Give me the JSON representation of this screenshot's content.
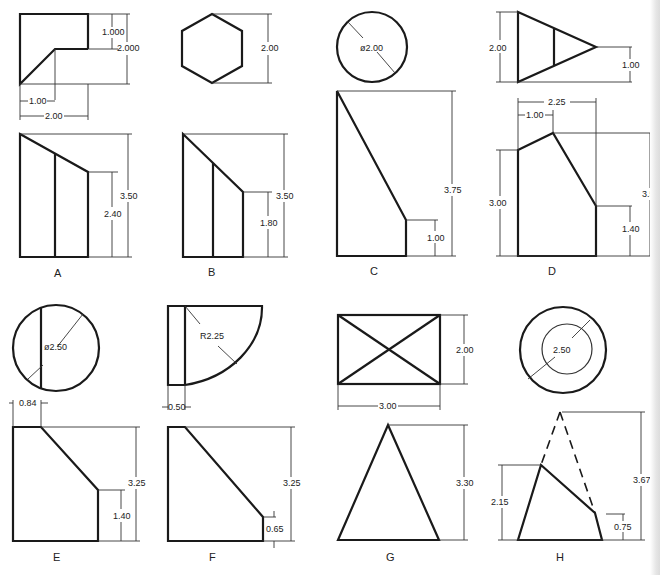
{
  "figures": [
    {
      "label": "A",
      "top_view": {
        "shape": "square-with-notch",
        "dims": [
          "1.000",
          "2.000",
          "1.00",
          "2.00"
        ]
      },
      "front_view": {
        "dims": [
          "3.50",
          "2.40"
        ]
      }
    },
    {
      "label": "B",
      "top_view": {
        "shape": "hexagon",
        "dims": [
          "2.00"
        ]
      },
      "front_view": {
        "dims": [
          "3.50",
          "1.80"
        ]
      }
    },
    {
      "label": "C",
      "top_view": {
        "shape": "circle",
        "dims": [
          "ø2.00"
        ]
      },
      "front_view": {
        "dims": [
          "3.75",
          "1.00"
        ]
      }
    },
    {
      "label": "D",
      "top_view": {
        "shape": "triangle",
        "dims": [
          "2.00",
          "1.00"
        ]
      },
      "front_view": {
        "dims": [
          "2.25",
          "1.00",
          "3.00",
          "3.50",
          "1.40"
        ]
      }
    },
    {
      "label": "E",
      "top_view": {
        "shape": "circle-with-chord",
        "dims": [
          "ø2.50"
        ]
      },
      "front_view": {
        "dims": [
          "0.84",
          "3.25",
          "1.40"
        ]
      }
    },
    {
      "label": "F",
      "top_view": {
        "shape": "quarter-round",
        "dims": [
          "R2.25",
          "0.50"
        ]
      },
      "front_view": {
        "dims": [
          "3.25",
          "0.65"
        ]
      }
    },
    {
      "label": "G",
      "top_view": {
        "shape": "rectangle-with-diagonals",
        "dims": [
          "2.00",
          "3.00"
        ]
      },
      "front_view": {
        "dims": [
          "3.30"
        ]
      }
    },
    {
      "label": "H",
      "top_view": {
        "shape": "concentric-circles",
        "dims": [
          "2.50"
        ]
      },
      "front_view": {
        "dims": [
          "3.67",
          "2.15",
          "0.75"
        ]
      }
    }
  ],
  "text": {
    "A_top_1000": "1.000",
    "A_top_2000": "2.000",
    "A_top_100": "1.00",
    "A_top_200": "2.00",
    "A_front_350": "3.50",
    "A_front_240": "2.40",
    "A_label": "A",
    "B_top_200": "2.00",
    "B_front_350": "3.50",
    "B_front_180": "1.80",
    "B_label": "B",
    "C_top_dia": "ø2.00",
    "C_front_375": "3.75",
    "C_front_100": "1.00",
    "C_label": "C",
    "D_top_200": "2.00",
    "D_top_100": "1.00",
    "D_front_225": "2.25",
    "D_front_100": "1.00",
    "D_front_300": "3.00",
    "D_front_350": "3.50",
    "D_front_140": "1.40",
    "D_label": "D",
    "E_top_dia": "ø2.50",
    "E_front_084": "0.84",
    "E_front_325": "3.25",
    "E_front_140": "1.40",
    "E_label": "E",
    "F_top_r": "R2.25",
    "F_top_050": "0.50",
    "F_front_325": "3.25",
    "F_front_065": "0.65",
    "F_label": "F",
    "G_top_200": "2.00",
    "G_top_300": "3.00",
    "G_front_330": "3.30",
    "G_label": "G",
    "H_top_250": "2.50",
    "H_front_367": "3.67",
    "H_front_215": "2.15",
    "H_front_075": "0.75",
    "H_label": "H"
  }
}
